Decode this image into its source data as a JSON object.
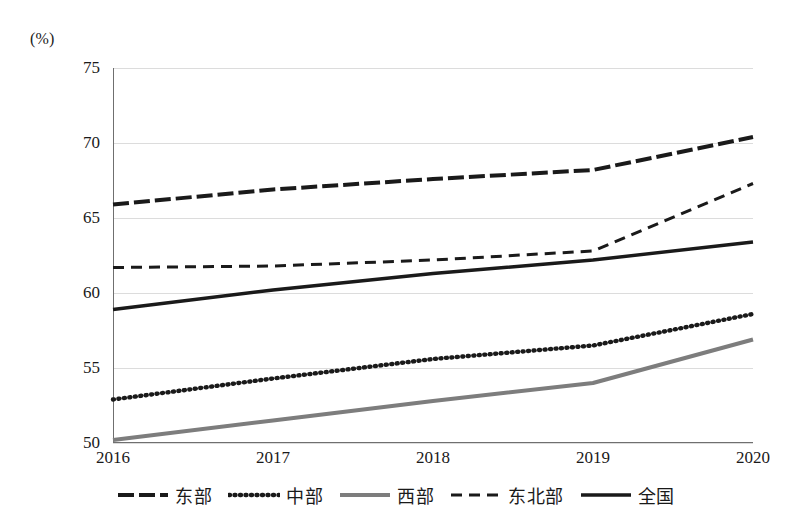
{
  "chart_data": {
    "type": "line",
    "title": "",
    "xlabel": "(年份)",
    "ylabel": "(%)",
    "categories": [
      "2016",
      "2017",
      "2018",
      "2019",
      "2020"
    ],
    "x": [
      2016,
      2017,
      2018,
      2019,
      2020
    ],
    "ylim": [
      50,
      75
    ],
    "yticks": [
      50,
      55,
      60,
      65,
      70,
      75
    ],
    "ytick_labels": [
      "50",
      "55",
      "60",
      "65",
      "70",
      "75"
    ],
    "grid": "horizontal",
    "legend_position": "bottom",
    "series": [
      {
        "name": "东部",
        "values": [
          65.9,
          66.9,
          67.6,
          68.2,
          70.4
        ],
        "color": "#1a1a1a",
        "style": "long-dash",
        "dasharray": "16,5",
        "width": 4
      },
      {
        "name": "中部",
        "values": [
          52.9,
          54.3,
          55.6,
          56.5,
          58.6
        ],
        "color": "#1a1a1a",
        "style": "dotted",
        "dasharray": "1,4.5",
        "width": 4.4
      },
      {
        "name": "西部",
        "values": [
          50.2,
          51.5,
          52.8,
          54.0,
          56.9
        ],
        "color": "#7d7d7d",
        "style": "solid",
        "dasharray": "none",
        "width": 4
      },
      {
        "name": "东北部",
        "values": [
          61.7,
          61.8,
          62.2,
          62.8,
          67.3
        ],
        "color": "#1a1a1a",
        "style": "dashed",
        "dasharray": "11,7",
        "width": 3
      },
      {
        "name": "全国",
        "values": [
          58.9,
          60.2,
          61.3,
          62.2,
          63.4
        ],
        "color": "#1a1a1a",
        "style": "solid",
        "dasharray": "none",
        "width": 3.4
      }
    ]
  },
  "axis": {
    "y_unit_label": "(%)",
    "x_title": "(年份)"
  },
  "legend": {
    "items": [
      {
        "label": "东部"
      },
      {
        "label": "中部"
      },
      {
        "label": "西部"
      },
      {
        "label": "东北部"
      },
      {
        "label": "全国"
      }
    ]
  }
}
